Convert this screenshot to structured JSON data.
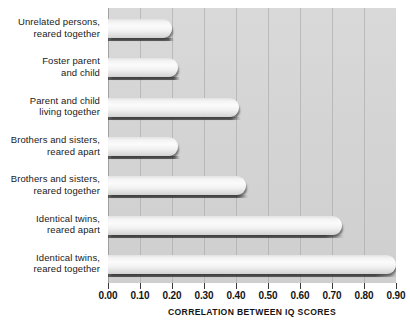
{
  "chart_data": {
    "type": "bar",
    "orientation": "horizontal",
    "title": "",
    "xlabel": "CORRELATION BETWEEN IQ SCORES",
    "ylabel": "",
    "xlim": [
      0.0,
      0.9
    ],
    "grid": true,
    "legend": false,
    "categories": [
      "Unrelated persons, reared together",
      "Foster parent and child",
      "Parent and child living together",
      "Brothers and sisters, reared apart",
      "Brothers and sisters, reared together",
      "Identical twins, reared apart",
      "Identical twins, reared together"
    ],
    "values": [
      0.2,
      0.22,
      0.41,
      0.22,
      0.43,
      0.73,
      0.9
    ],
    "category_lines": [
      [
        "Unrelated persons,",
        "reared together"
      ],
      [
        "Foster parent",
        "and child"
      ],
      [
        "Parent and child",
        "living together"
      ],
      [
        "Brothers and sisters,",
        "reared apart"
      ],
      [
        "Brothers and sisters,",
        "reared together"
      ],
      [
        "Identical twins,",
        "reared apart"
      ],
      [
        "Identical twins,",
        "reared together"
      ]
    ],
    "xticks": [
      0.0,
      0.1,
      0.2,
      0.3,
      0.4,
      0.5,
      0.6,
      0.7,
      0.8,
      0.9
    ],
    "xtick_labels": [
      "0.00",
      "0.10",
      "0.20",
      "0.30",
      "0.40",
      "0.50",
      "0.60",
      "0.70",
      "0.80",
      "0.90"
    ],
    "colors": {
      "plot_background": "#d5d5d5",
      "bar_fill": "#f6f6f6",
      "bar_shadow": "#464646",
      "gridline": "#969696",
      "text": "#141414",
      "page_background": "#ffffff"
    }
  }
}
